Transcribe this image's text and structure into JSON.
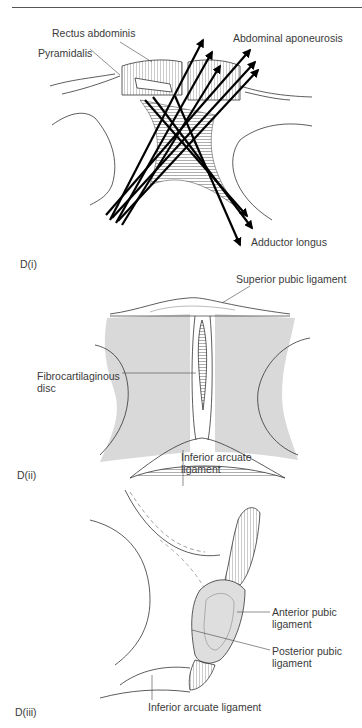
{
  "figure": {
    "panels": [
      {
        "id": "D(i)",
        "label": "D(i)",
        "annotations": {
          "rectus_abdominis": "Rectus abdominis",
          "pyramidalis": "Pyramidalis",
          "abdominal_aponeurosis": "Abdominal aponeurosis",
          "adductor_longus": "Adductor longus"
        }
      },
      {
        "id": "D(ii)",
        "label": "D(ii)",
        "annotations": {
          "superior_pubic_ligament": "Superior pubic ligament",
          "fibrocartilaginous_disc_line1": "Fibrocartilaginous",
          "fibrocartilaginous_disc_line2": "disc",
          "inferior_arcuate_ligament_line1": "Inferior arcuate",
          "inferior_arcuate_ligament_line2": "ligament"
        }
      },
      {
        "id": "D(iii)",
        "label": "D(iii)",
        "annotations": {
          "anterior_pubic_ligament_line1": "Anterior pubic",
          "anterior_pubic_ligament_line2": "ligament",
          "posterior_pubic_ligament_line1": "Posterior pubic",
          "posterior_pubic_ligament_line2": "ligament",
          "inferior_arcuate_ligament": "Inferior arcuate ligament"
        }
      }
    ],
    "colors": {
      "line": "#333333",
      "bone_fill": "#d9d9d9",
      "label_text": "#3a3a3a",
      "arrow": "#000000"
    }
  }
}
